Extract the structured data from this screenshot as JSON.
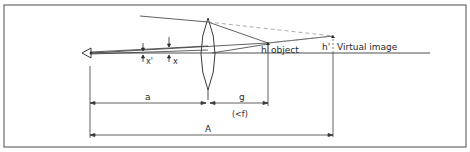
{
  "diagram": {
    "type": "optical ray diagram (magnifying lens, virtual image)",
    "labels": {
      "object_h": "h",
      "object": "object",
      "image_h": "h'",
      "virtual_image": "Virtual image",
      "x_prime": "x'",
      "x": "x",
      "a": "a",
      "g": "g",
      "g_note": "(<f)",
      "A": "A"
    },
    "colors": {
      "line": "#3a3a3a",
      "dashed": "#8a8a8a",
      "frame": "#6a6a6a",
      "background": "#ffffff"
    }
  }
}
